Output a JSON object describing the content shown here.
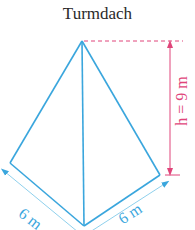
{
  "title": "Turmdach",
  "diagram": {
    "shape": "square pyramid (tower roof)",
    "labels": {
      "height": "h = 9 m",
      "edge_left": "6 m",
      "edge_right": "6 m"
    },
    "colors": {
      "edges": "#3aa6dd",
      "dimension_edges": "#8fd0ec",
      "height": "#e0457a"
    }
  }
}
